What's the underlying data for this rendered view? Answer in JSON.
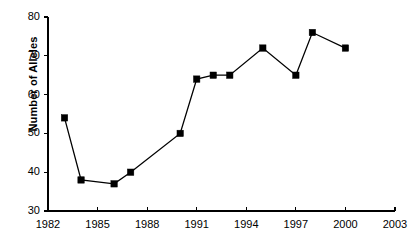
{
  "chart_data": {
    "type": "line",
    "title": "",
    "subtitle": "",
    "xlabel": "",
    "ylabel": "Number of Alleles",
    "x": [
      1983,
      1984,
      1986,
      1987,
      1990,
      1991,
      1992,
      1993,
      1995,
      1997,
      1998,
      2000
    ],
    "values": [
      54,
      38,
      37,
      40,
      50,
      64,
      65,
      65,
      72,
      65,
      76,
      72
    ],
    "series": [
      {
        "name": "Number of Alleles",
        "x": [
          1983,
          1984,
          1986,
          1987,
          1990,
          1991,
          1992,
          1993,
          1995,
          1997,
          1998,
          2000
        ],
        "values": [
          54,
          38,
          37,
          40,
          50,
          64,
          65,
          65,
          72,
          65,
          76,
          72
        ],
        "marker": "square",
        "color": "#000000"
      }
    ],
    "xlim": [
      1982,
      2003
    ],
    "ylim": [
      30,
      80
    ],
    "xticks": [
      1982,
      1985,
      1988,
      1991,
      1994,
      1997,
      2000,
      2003
    ],
    "xtick_labels": [
      "1982",
      "1985",
      "1988",
      "1991",
      "1994",
      "1997",
      "2000",
      "2003"
    ],
    "yticks": [
      30,
      40,
      50,
      60,
      70,
      80
    ],
    "ytick_labels": [
      "30",
      "40",
      "50",
      "60",
      "70",
      "80"
    ],
    "grid": false,
    "legend": false,
    "legend_position": "none",
    "line_color": "#000000",
    "marker_color": "#000000",
    "background_color": "#ffffff",
    "axis_color": "#000000"
  },
  "axes": {
    "y_title": "Number of Alleles"
  }
}
